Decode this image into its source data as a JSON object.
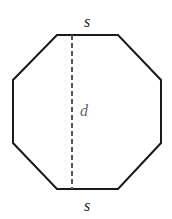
{
  "diagram": {
    "shape": "regular-octagon",
    "stroke_color": "#1a1a1a",
    "dash_color": "#555555",
    "label_color": "#222222",
    "d_label_color": "#666666",
    "vertices": [
      [
        57,
        35
      ],
      [
        118,
        35
      ],
      [
        161,
        80
      ],
      [
        161,
        143
      ],
      [
        118,
        189
      ],
      [
        57,
        189
      ],
      [
        13,
        143
      ],
      [
        13,
        80
      ]
    ],
    "diameter_line": {
      "x": 72,
      "y1": 35,
      "y2": 189
    },
    "labels": {
      "top_side": "s",
      "bottom_side": "s",
      "diameter": "d"
    }
  }
}
